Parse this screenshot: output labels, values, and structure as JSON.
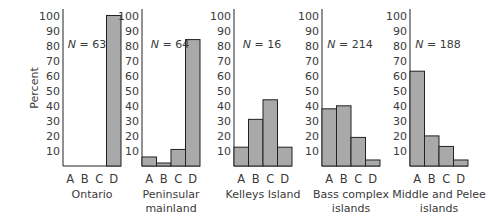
{
  "chart_data": {
    "type": "bar",
    "title": "",
    "ylabel": "Percent",
    "ylim": [
      0,
      100
    ],
    "yticks": [
      10,
      20,
      30,
      40,
      50,
      60,
      70,
      80,
      90,
      100
    ],
    "categories": [
      "A",
      "B",
      "C",
      "D"
    ],
    "bar_color": "#a9a9a9",
    "panels": [
      {
        "name": "Ontario",
        "label_lines": [
          "Ontario"
        ],
        "n_label": "N = 63",
        "values": [
          0,
          0,
          0,
          100
        ]
      },
      {
        "name": "Peninsular mainland",
        "label_lines": [
          "Peninsular",
          "mainland"
        ],
        "n_label": "N = 64",
        "values": [
          6,
          2,
          11,
          84
        ]
      },
      {
        "name": "Kelleys Island",
        "label_lines": [
          "Kelleys Island"
        ],
        "n_label": "N = 16",
        "values": [
          12.5,
          31,
          44,
          12.5
        ]
      },
      {
        "name": "Bass complex islands",
        "label_lines": [
          "Bass complex",
          "islands"
        ],
        "n_label": "N = 214",
        "values": [
          38,
          40,
          19,
          4
        ]
      },
      {
        "name": "Middle and Pelee islands",
        "label_lines": [
          "Middle and Pelee",
          "islands"
        ],
        "n_label": "N = 188",
        "values": [
          63,
          20,
          13,
          4
        ]
      }
    ]
  }
}
